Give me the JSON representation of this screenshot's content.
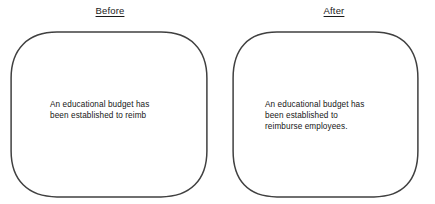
{
  "canvas": {
    "width": 435,
    "height": 204,
    "background_color": "#ffffff"
  },
  "style": {
    "shape_stroke_color": "#404040",
    "shape_fill_color": "#ffffff",
    "text_color": "#161616",
    "heading_color": "#1a1a1a"
  },
  "panels": [
    {
      "heading": "Before",
      "shape": "rounded-rectangle",
      "body_text": "An educational budget has\nbeen established to reimb"
    },
    {
      "heading": "After",
      "shape": "rounded-rectangle",
      "body_text": "An educational budget has\nbeen established to\nreimburse employees."
    }
  ]
}
